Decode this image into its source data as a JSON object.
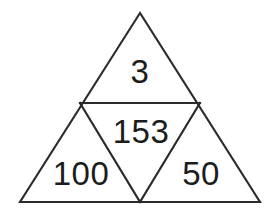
{
  "figure": {
    "type": "subdivided-triangle",
    "background_color": "#ffffff",
    "stroke_color": "#2b2b2b",
    "text_color": "#1c1c1c"
  },
  "geometry": {
    "outer_triangle": {
      "apex": {
        "x": 140,
        "y": 13
      },
      "bottom_left": {
        "x": 20,
        "y": 202
      },
      "bottom_right": {
        "x": 260,
        "y": 202
      }
    },
    "midpoints": {
      "left_edge": {
        "x": 80,
        "y": 103
      },
      "right_edge": {
        "x": 200,
        "y": 103
      },
      "base": {
        "x": 140,
        "y": 202
      }
    },
    "outer_path": "M 140 13 L 20 202 L 260 202 Z",
    "horizontal_divider_path": "M 80 103 L 200 103",
    "left_diagonal_path": "M 80 103 L 140 202",
    "right_diagonal_path": "M 200 103 L 140 202"
  },
  "regions": {
    "top": {
      "name": "top-triangle",
      "value": "3"
    },
    "center": {
      "name": "center-inverted-triangle",
      "value": "153"
    },
    "bottom_left": {
      "name": "bottom-left-triangle",
      "value": "100"
    },
    "bottom_right": {
      "name": "bottom-right-triangle",
      "value": "50"
    }
  }
}
